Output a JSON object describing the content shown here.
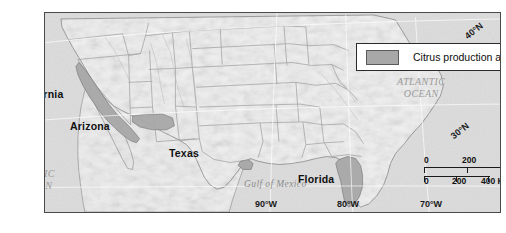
{
  "map": {
    "title_absent": "",
    "legend": {
      "swatch_name": "citrus-swatch",
      "label": "Citrus production areas",
      "swatch_color": "#a8a8a8"
    },
    "state_labels": [
      {
        "name": "california",
        "text": "California"
      },
      {
        "name": "arizona",
        "text": "Arizona"
      },
      {
        "name": "texas",
        "text": "Texas"
      },
      {
        "name": "florida",
        "text": "Florida"
      }
    ],
    "water_labels": [
      {
        "name": "pacific-ocean",
        "line1": "PACIFIC",
        "line2": "OCEAN"
      },
      {
        "name": "atlantic-ocean",
        "line1": "ATLANTIC",
        "line2": "OCEAN"
      },
      {
        "name": "gulf-of-mexico",
        "line1": "Gulf of Mexico",
        "line2": ""
      }
    ],
    "graticule_labels": [
      {
        "name": "lat-40n",
        "text": "40°N"
      },
      {
        "name": "lat-30n",
        "text": "30°N"
      },
      {
        "name": "lon-90w",
        "text": "90°W"
      },
      {
        "name": "lon-80w",
        "text": "80°W"
      },
      {
        "name": "lon-70w",
        "text": "70°W"
      }
    ],
    "scale_bars": [
      {
        "name": "miles-scale",
        "unit": "Miles",
        "ticks": [
          "0",
          "200",
          "400"
        ],
        "end_label": "400 Miles"
      },
      {
        "name": "kilometers-scale",
        "unit": "Kilometers",
        "ticks": [
          "0",
          "200",
          "400"
        ],
        "end_label": "400 Kilometers"
      }
    ],
    "colors": {
      "citrus_fill": "#a8a8a8",
      "land_fill": "#f2f2f2",
      "ocean_fill": "#d9d9d9",
      "border_line": "#4a4a4a",
      "state_line": "#9b9b9b"
    }
  }
}
